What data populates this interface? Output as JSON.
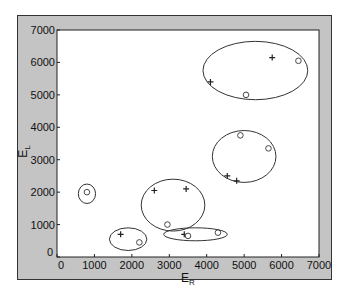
{
  "chart_data": {
    "type": "scatter",
    "title": "",
    "xlabel": "E_R",
    "ylabel": "E_L",
    "xlim": [
      0,
      7000
    ],
    "ylim": [
      0,
      7000
    ],
    "xticks": [
      0,
      1000,
      2000,
      3000,
      4000,
      5000,
      6000,
      7000
    ],
    "yticks": [
      0,
      1000,
      2000,
      3000,
      4000,
      5000,
      6000,
      7000
    ],
    "grid": false,
    "series": [
      {
        "name": "plus",
        "marker": "+",
        "points": [
          [
            5750,
            6150
          ],
          [
            4100,
            5400
          ],
          [
            2600,
            2050
          ],
          [
            3450,
            2100
          ],
          [
            4550,
            2500
          ],
          [
            4800,
            2350
          ],
          [
            3400,
            700
          ],
          [
            1700,
            700
          ]
        ]
      },
      {
        "name": "circle",
        "marker": "o",
        "points": [
          [
            6450,
            6050
          ],
          [
            5050,
            5000
          ],
          [
            4900,
            3750
          ],
          [
            5650,
            3350
          ],
          [
            2950,
            1000
          ],
          [
            3500,
            650
          ],
          [
            4300,
            750
          ],
          [
            800,
            2000
          ],
          [
            2200,
            450
          ]
        ]
      }
    ],
    "ellipses": [
      {
        "cx": 5300,
        "cy": 5750,
        "rx": 1400,
        "ry": 900
      },
      {
        "cx": 5000,
        "cy": 3100,
        "rx": 850,
        "ry": 800
      },
      {
        "cx": 3100,
        "cy": 1600,
        "rx": 850,
        "ry": 800
      },
      {
        "cx": 3700,
        "cy": 700,
        "rx": 850,
        "ry": 200
      },
      {
        "cx": 1900,
        "cy": 550,
        "rx": 500,
        "ry": 350
      },
      {
        "cx": 800,
        "cy": 1950,
        "rx": 230,
        "ry": 300
      }
    ]
  }
}
